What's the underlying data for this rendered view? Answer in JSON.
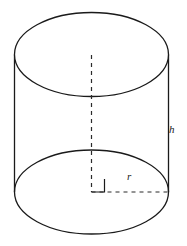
{
  "figure": {
    "name": "cylinder-diagram",
    "background_color": "#ffffff",
    "stroke_color": "#1a1a1a",
    "canvas": {
      "width": 187,
      "height": 246
    },
    "labels": {
      "height": "h",
      "radius": "r"
    },
    "geometry": {
      "top_ellipse": {
        "cx": 91.5,
        "cy": 54.5,
        "rx": 77,
        "ry": 42,
        "style": "solid"
      },
      "bottom_ellipse": {
        "cx": 91.5,
        "cy": 192,
        "rx": 77,
        "ry": 42,
        "style": "solid"
      },
      "left_side": {
        "x": 14.5,
        "y1": 54.5,
        "y2": 192,
        "style": "solid"
      },
      "right_side": {
        "x": 168.5,
        "y1": 54.5,
        "y2": 192,
        "style": "solid"
      },
      "axis_line": {
        "x": 91.5,
        "y1": 55,
        "y2": 192,
        "style": "dashed"
      },
      "radius_line": {
        "y": 192,
        "x1": 91.5,
        "x2": 168.5,
        "style": "dashed"
      },
      "right_angle_marker": {
        "x": 91.5,
        "y": 192,
        "size": 13,
        "style": "solid"
      }
    }
  }
}
